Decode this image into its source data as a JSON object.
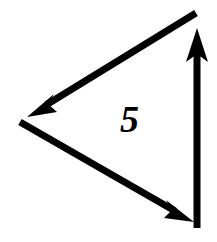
{
  "figure": {
    "background_color": "#ffffff",
    "stroke_color": "#000000",
    "width": 217,
    "height": 242,
    "labels": [
      {
        "id": "side-5",
        "text": "5",
        "x": 133,
        "y": 120,
        "color": "#000000"
      }
    ],
    "arrows": [
      {
        "id": "top-arrow",
        "name": "hypotenuse-arrow",
        "from": [
          196,
          13
        ],
        "to": [
          27,
          117
        ],
        "direction": "down-left",
        "head_at": "to",
        "stroke_width": 7
      },
      {
        "id": "bottom-arrow",
        "name": "lower-arrow",
        "from": [
          20,
          122
        ],
        "to": [
          194,
          222
        ],
        "direction": "down-right",
        "head_at": "to",
        "stroke_width": 7
      },
      {
        "id": "right-arrow",
        "name": "vertical-arrow",
        "from": [
          197,
          228
        ],
        "to": [
          197,
          28
        ],
        "direction": "up",
        "head_at": "to",
        "stroke_width": 7
      }
    ]
  }
}
